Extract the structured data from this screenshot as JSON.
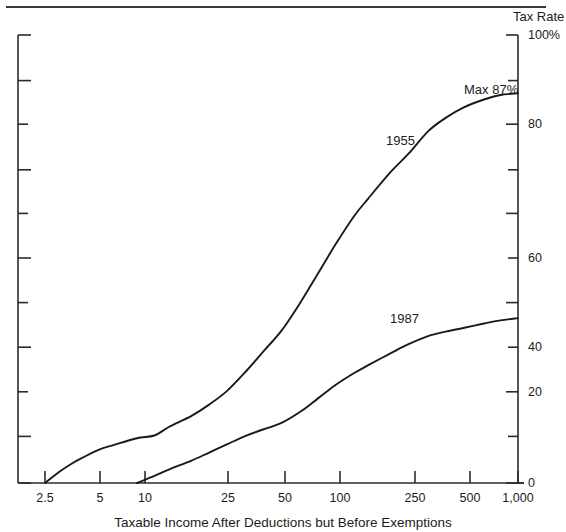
{
  "chart_data": {
    "type": "line",
    "title": "",
    "subtitle": "",
    "xlabel": "Taxable Income After Deductions but Before Exemptions",
    "ylabel": "Tax Rate",
    "xscale": "log",
    "xticks": [
      2.5,
      5,
      10,
      25,
      50,
      100,
      250,
      500,
      1000
    ],
    "xticklabels": [
      "2.5",
      "5",
      "10",
      "25",
      "50",
      "100",
      "250",
      "500",
      "1,000"
    ],
    "yticks": [
      0,
      20,
      40,
      60,
      80,
      100
    ],
    "yticklabels": [
      "0",
      "20",
      "40",
      "60",
      "80",
      "100%"
    ],
    "yminorticks": [
      10,
      30,
      50,
      70,
      90
    ],
    "ylim": [
      0,
      100
    ],
    "grid": false,
    "legend_position": "inline-annotations",
    "annotations": [
      {
        "text": "Max 87%",
        "x": 700,
        "y": 90
      },
      {
        "text": "1955",
        "x": 62,
        "y": 70
      },
      {
        "text": "1987",
        "x": 120,
        "y": 40
      }
    ],
    "series": [
      {
        "name": "1955",
        "label": "1955",
        "x": [
          2.5,
          3,
          3.5,
          4,
          5,
          6,
          8,
          10,
          12,
          16,
          20,
          25,
          32,
          40,
          50,
          64,
          80,
          100,
          125,
          150,
          200,
          250,
          320,
          400,
          500,
          650,
          800,
          1000
        ],
        "y": [
          0,
          2.5,
          4.3,
          5.6,
          7.5,
          8.5,
          10.0,
          10.6,
          12.5,
          15.0,
          17.5,
          20.5,
          25.0,
          29.5,
          34.0,
          40.5,
          47.0,
          53.5,
          59.5,
          63.5,
          69.5,
          73.5,
          78.5,
          81.5,
          83.8,
          85.6,
          86.6,
          87.0
        ]
      },
      {
        "name": "1987",
        "label": "1987",
        "x": [
          8,
          10,
          12,
          16,
          20,
          25,
          32,
          40,
          50,
          64,
          80,
          100,
          125,
          150,
          200,
          250,
          320,
          400,
          500,
          650,
          800,
          1000
        ],
        "y": [
          0,
          1.6,
          3.0,
          5.0,
          6.8,
          8.6,
          10.6,
          12.0,
          13.4,
          16.0,
          19.0,
          22.0,
          24.5,
          26.3,
          29.0,
          31.0,
          32.8,
          33.8,
          34.6,
          35.6,
          36.3,
          36.8
        ]
      }
    ]
  },
  "axes": {
    "y_right_title": "Tax Rate",
    "x_title": "Taxable Income After Deductions but Before Exemptions"
  },
  "colors": {
    "line": "#1a1a1a",
    "axis": "#2b2b2b",
    "text": "#1c1c1c",
    "background": "#ffffff"
  }
}
